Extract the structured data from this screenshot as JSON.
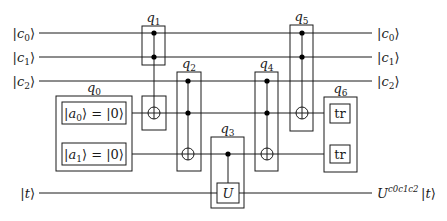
{
  "diagram": {
    "type": "quantum-circuit",
    "width": 447,
    "height": 221,
    "wires": [
      {
        "id": "c0",
        "y": 33,
        "x1": 39,
        "x2": 372,
        "left_label": {
          "ket": "c",
          "sub": "0"
        },
        "right_label": {
          "ket": "c",
          "sub": "0"
        }
      },
      {
        "id": "c1",
        "y": 57,
        "x1": 39,
        "x2": 372,
        "left_label": {
          "ket": "c",
          "sub": "1"
        },
        "right_label": {
          "ket": "c",
          "sub": "1"
        }
      },
      {
        "id": "c2",
        "y": 81,
        "x1": 39,
        "x2": 372,
        "left_label": {
          "ket": "c",
          "sub": "2"
        },
        "right_label": {
          "ket": "c",
          "sub": "2"
        }
      },
      {
        "id": "a0",
        "y": 113,
        "x1": 126,
        "x2": 330
      },
      {
        "id": "a1",
        "y": 154,
        "x1": 126,
        "x2": 330
      },
      {
        "id": "t",
        "y": 193,
        "x1": 39,
        "x2": 372,
        "left_label": {
          "ket": "t"
        },
        "right_label": {
          "pre": "U",
          "sup": "c₀c₁c₂",
          "ket": "t"
        }
      }
    ],
    "groups": [
      {
        "id": "q0",
        "label": "q",
        "label_sub": "0",
        "x": 56,
        "y": 96,
        "w": 76,
        "h": 75,
        "inits": [
          {
            "text_var": "a",
            "sub": "0",
            "value": "0",
            "x": 62,
            "y": 102,
            "w": 64,
            "h": 22
          },
          {
            "text_var": "a",
            "sub": "1",
            "value": "0",
            "x": 62,
            "y": 143,
            "w": 64,
            "h": 22
          }
        ]
      },
      {
        "id": "q1",
        "label": "q",
        "label_sub": "1",
        "x": 142,
        "y": 26,
        "w": 23,
        "h": 39,
        "wire_x": 154,
        "controls": [
          33,
          57
        ],
        "targets": [
          113
        ],
        "extra_box": {
          "x": 142,
          "y": 96,
          "w": 24,
          "h": 34
        }
      },
      {
        "id": "q2",
        "label": "q",
        "label_sub": "2",
        "x": 177,
        "y": 72,
        "w": 24,
        "h": 99,
        "wire_x": 188,
        "controls": [
          81,
          113
        ],
        "targets": [
          154
        ]
      },
      {
        "id": "q3",
        "label": "q",
        "label_sub": "3",
        "x": 211,
        "y": 137,
        "w": 33,
        "h": 71,
        "wire_x": 228,
        "controls": [
          154
        ],
        "gate": {
          "label": "U",
          "x": 217,
          "y": 183,
          "w": 22,
          "h": 20
        }
      },
      {
        "id": "q4",
        "label": "q",
        "label_sub": "4",
        "x": 255,
        "y": 72,
        "w": 23,
        "h": 99,
        "wire_x": 267,
        "controls": [
          81,
          113
        ],
        "targets": [
          154
        ]
      },
      {
        "id": "q5",
        "label": "q",
        "label_sub": "5",
        "x": 290,
        "y": 25,
        "w": 23,
        "h": 106,
        "wire_x": 302,
        "controls": [
          33,
          57
        ],
        "targets": [
          113
        ]
      },
      {
        "id": "q6",
        "label": "q",
        "label_sub": "6",
        "x": 324,
        "y": 97,
        "w": 33,
        "h": 75,
        "traces": [
          {
            "label": "tr",
            "x": 330,
            "y": 104,
            "w": 20,
            "h": 19
          },
          {
            "label": "tr",
            "x": 330,
            "y": 145,
            "w": 20,
            "h": 18
          }
        ]
      }
    ],
    "colors": {
      "line": "#1a1a1a",
      "background": "#ffffff"
    }
  }
}
